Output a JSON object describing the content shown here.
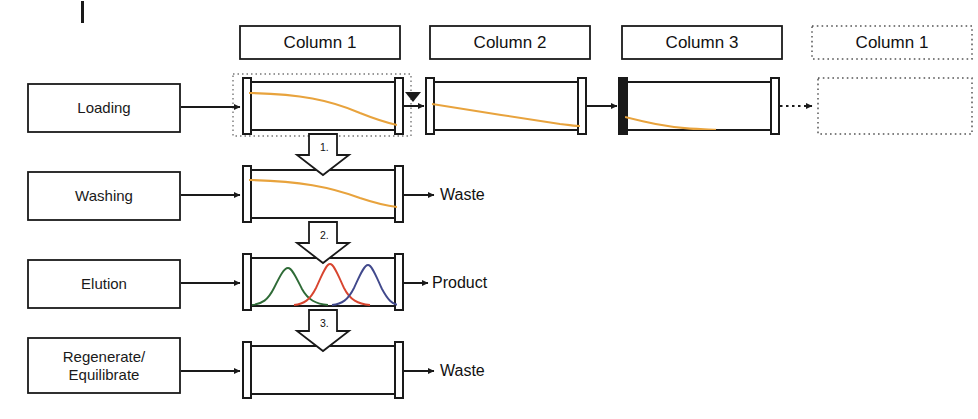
{
  "diagram": {
    "title_tick": "",
    "stages": [
      {
        "id": "loading",
        "label": "Loading"
      },
      {
        "id": "washing",
        "label": "Washing"
      },
      {
        "id": "elution",
        "label": "Elution"
      },
      {
        "id": "regenerate",
        "label": "Regenerate/\nEquilibrate"
      }
    ],
    "column_headers": [
      {
        "id": "col1",
        "label": "Column 1",
        "style": "solid"
      },
      {
        "id": "col2",
        "label": "Column 2",
        "style": "solid"
      },
      {
        "id": "col3",
        "label": "Column 3",
        "style": "solid"
      },
      {
        "id": "col1-next",
        "label": "Column 1",
        "style": "dotted"
      }
    ],
    "outputs": [
      {
        "id": "washing-output",
        "label": "Waste"
      },
      {
        "id": "elution-output",
        "label": "Product"
      },
      {
        "id": "regenerate-output",
        "label": "Waste"
      }
    ],
    "step_arrows": [
      {
        "id": "step-1",
        "label": "1."
      },
      {
        "id": "step-2",
        "label": "2."
      },
      {
        "id": "step-3",
        "label": "3."
      }
    ],
    "colors": {
      "line": "#1a1a1a",
      "breakthrough_curve": "#e8a33d",
      "peak_green": "#2f6b37",
      "peak_red": "#d8452f",
      "peak_blue": "#41498c",
      "background": "#ffffff"
    },
    "columns": {
      "loading_row": [
        {
          "id": "load-col-1",
          "curve": "breakthrough-early",
          "color": "#e8a33d"
        },
        {
          "id": "load-col-2",
          "curve": "breakthrough-mid",
          "color": "#e8a33d"
        },
        {
          "id": "load-col-3",
          "curve": "breakthrough-late",
          "color": "#e8a33d"
        },
        {
          "id": "load-col-next",
          "curve": "none",
          "color": ""
        }
      ],
      "washing_row": [
        {
          "id": "wash-col-1",
          "curve": "breakthrough-early",
          "color": "#e8a33d"
        }
      ],
      "elution_row": [
        {
          "id": "elute-col-1",
          "curve": "three-peaks",
          "color": ""
        }
      ],
      "regenerate_row": [
        {
          "id": "regen-col-1",
          "curve": "none",
          "color": ""
        }
      ]
    }
  }
}
